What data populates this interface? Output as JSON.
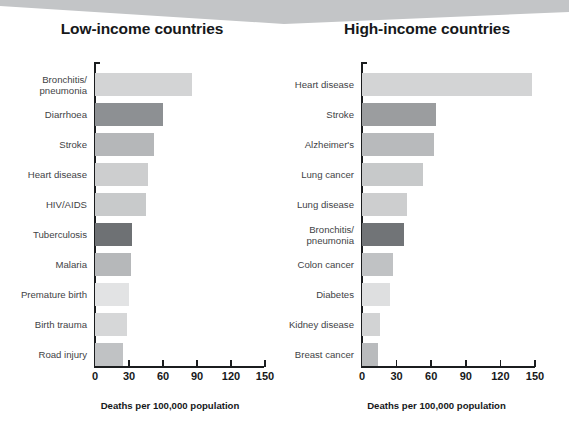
{
  "banner": {
    "shape": "chevron-banner",
    "color": "#c3c5c7"
  },
  "chart_data": [
    {
      "type": "bar",
      "orientation": "horizontal",
      "title": "Low-income countries",
      "xlabel": "Deaths per 100,000 population",
      "ylabel": "",
      "xlim": [
        0,
        150
      ],
      "xticks": [
        0,
        30,
        60,
        90,
        120,
        150
      ],
      "xticklabels": [
        "0",
        "30",
        "60",
        "90",
        "120",
        "150"
      ],
      "grid": false,
      "legend": "none",
      "categories": [
        "Bronchitis/\npneumonia",
        "Diarrhoea",
        "Stroke",
        "Heart disease",
        "HIV/AIDS",
        "Tuberculosis",
        "Malaria",
        "Premature birth",
        "Birth trauma",
        "Road injury"
      ],
      "values": [
        86,
        60,
        52,
        47,
        45,
        33,
        32,
        30,
        28,
        25
      ],
      "colors": [
        "#d3d4d5",
        "#8d9093",
        "#b5b7b9",
        "#cdcecf",
        "#c8cacb",
        "#6e7174",
        "#b6b8ba",
        "#e2e3e4",
        "#d6d7d8",
        "#c0c2c4"
      ]
    },
    {
      "type": "bar",
      "orientation": "horizontal",
      "title": "High-income countries",
      "xlabel": "Deaths per 100,000 population",
      "ylabel": "",
      "xlim": [
        0,
        150
      ],
      "xticks": [
        0,
        30,
        60,
        90,
        120,
        150
      ],
      "xticklabels": [
        "0",
        "30",
        "60",
        "90",
        "120",
        "150"
      ],
      "grid": false,
      "legend": "none",
      "categories": [
        "Heart disease",
        "Stroke",
        "Alzheimer's",
        "Lung cancer",
        "Lung disease",
        "Bronchitis/\npneumonia",
        "Colon cancer",
        "Diabetes",
        "Kidney disease",
        "Breast cancer"
      ],
      "values": [
        147,
        64,
        62,
        53,
        39,
        36,
        27,
        24,
        16,
        14
      ],
      "colors": [
        "#d3d4d5",
        "#9b9d9f",
        "#b8babc",
        "#c7c9ca",
        "#cdcecf",
        "#717477",
        "#c0c2c4",
        "#dedfe0",
        "#d2d3d4",
        "#b9bbbd"
      ]
    }
  ]
}
